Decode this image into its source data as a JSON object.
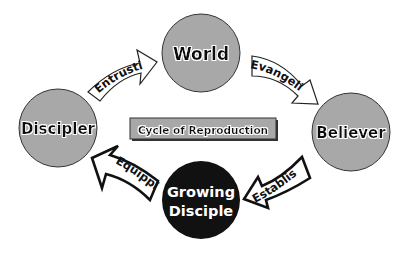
{
  "title": "Cycle of Reproduction",
  "nodes": {
    "world": {
      "label": "World",
      "fill": "#a8a8a8"
    },
    "believer": {
      "label": "Believer",
      "fill": "#a8a8a8"
    },
    "growing_disciple": {
      "label_line1": "Growing",
      "label_line2": "Disciple",
      "fill": "#111111"
    },
    "discipler": {
      "label": "Discipler",
      "fill": "#a8a8a8"
    }
  },
  "arrows": {
    "entrusting": {
      "label": "Entrusting",
      "from": "Discipler",
      "to": "World"
    },
    "evangelizing": {
      "label": "Evangelizing",
      "from": "World",
      "to": "Believer"
    },
    "establishing": {
      "label": "Establishing",
      "from": "Believer",
      "to": "Growing Disciple"
    },
    "equipping": {
      "label": "Equipping",
      "from": "Growing Disciple",
      "to": "Discipler"
    }
  },
  "colors": {
    "circle_gray": "#a8a8a8",
    "circle_dark": "#111111",
    "box_fill": "#a8a8a8",
    "outline": "#111111"
  }
}
